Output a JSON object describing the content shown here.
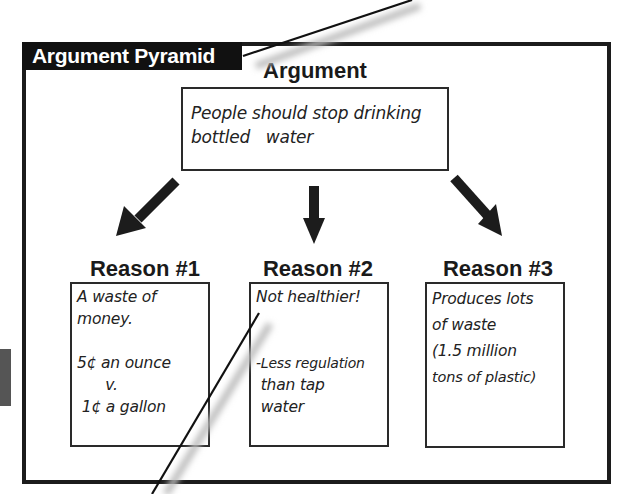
{
  "diagram": {
    "title": "Argument Pyramid",
    "argument": {
      "heading": "Argument",
      "text_lines": [
        "People should stop drinking",
        "bottled   water"
      ]
    },
    "reasons": [
      {
        "heading": "Reason #1",
        "lines": [
          "A waste of",
          "money.",
          "",
          "5¢ an ounce",
          "      v.",
          " 1¢ a gallon"
        ]
      },
      {
        "heading": "Reason #2",
        "lines": [
          "Not healthier!",
          "",
          "",
          "-Less regulation",
          " than tap",
          " water"
        ]
      },
      {
        "heading": "Reason #3",
        "lines": [
          "Produces lots",
          "of waste",
          "(1.5 million",
          "tons of plastic)"
        ]
      }
    ],
    "arrows": [
      "arrow-down-left",
      "arrow-down",
      "arrow-down-right"
    ],
    "colors": {
      "frame": "#1c1c1c",
      "title_bg": "#111111",
      "title_text": "#ffffff"
    }
  }
}
